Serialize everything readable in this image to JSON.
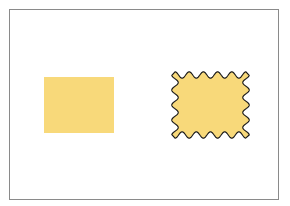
{
  "diagram": {
    "frame": {
      "border_color": "#8a8a8a"
    },
    "shapes": [
      {
        "id": "plain-rectangle",
        "type": "rectangle",
        "fill": "#f8d97a",
        "outline": "none"
      },
      {
        "id": "wavy-rectangle",
        "type": "wavy-edged-rectangle",
        "fill": "#f8d97a",
        "outline": "#1a1a1a",
        "waves_horizontal": 5,
        "waves_vertical": 4
      }
    ]
  }
}
